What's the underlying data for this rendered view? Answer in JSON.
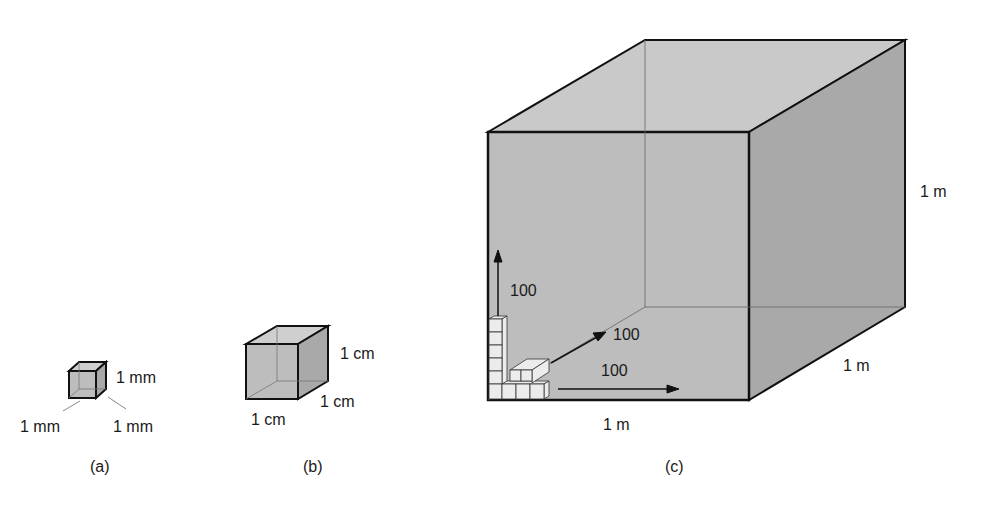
{
  "figure_a": {
    "caption": "(a)",
    "height_label": "1 mm",
    "width_label": "1 mm",
    "depth_label": "1 mm"
  },
  "figure_b": {
    "caption": "(b)",
    "height_label": "1 cm",
    "depth_label": "1 cm",
    "width_label": "1 cm"
  },
  "figure_c": {
    "caption": "(c)",
    "height_label": "1 m",
    "depth_label": "1 m",
    "width_label": "1 m",
    "arrow_up_label": "100",
    "arrow_diag_label": "100",
    "arrow_right_label": "100"
  },
  "colors": {
    "cube_front": "#bdbdbd",
    "cube_side": "#a9a9a9",
    "cube_top": "#c9c9c9",
    "edge": "#111111",
    "small_cube": "#ececec"
  }
}
